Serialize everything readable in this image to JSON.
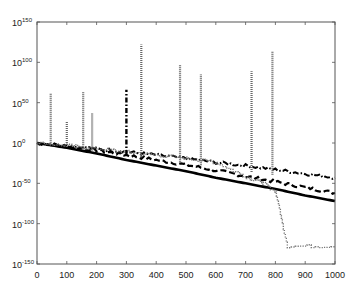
{
  "chart_data": {
    "type": "line",
    "title": "",
    "xlabel": "",
    "ylabel": "",
    "xlim": [
      0,
      1000
    ],
    "ylim_log10": [
      -150,
      150
    ],
    "yscale": "log",
    "grid": false,
    "legend": null,
    "x_ticks": [
      "0",
      "100",
      "200",
      "300",
      "400",
      "500",
      "600",
      "700",
      "800",
      "900",
      "1000"
    ],
    "y_ticks": [
      {
        "base": "10",
        "exp": "150"
      },
      {
        "base": "10",
        "exp": "100"
      },
      {
        "base": "10",
        "exp": "50"
      },
      {
        "base": "10",
        "exp": "0"
      },
      {
        "base": "10",
        "exp": "-50"
      },
      {
        "base": "10",
        "exp": "-100"
      },
      {
        "base": "10",
        "exp": "-150"
      }
    ],
    "series": [
      {
        "name": "solid",
        "style": "solid-thick",
        "x": [
          0,
          100,
          200,
          300,
          400,
          500,
          600,
          700,
          800,
          900,
          1000
        ],
        "log10_y": [
          0,
          -6,
          -13,
          -21,
          -28,
          -35,
          -43,
          -50,
          -57,
          -65,
          -72
        ]
      },
      {
        "name": "dashed",
        "style": "dashed",
        "x": [
          0,
          100,
          200,
          300,
          400,
          500,
          600,
          700,
          800,
          900,
          1000
        ],
        "log10_y": [
          0,
          -4,
          -9,
          -15,
          -21,
          -27,
          -34,
          -41,
          -48,
          -55,
          -62
        ]
      },
      {
        "name": "dash-dot",
        "style": "dash-dot",
        "x": [
          0,
          100,
          200,
          300,
          400,
          500,
          600,
          700,
          800,
          900,
          1000
        ],
        "log10_y": [
          0,
          -3,
          -7,
          -11,
          -15,
          -19,
          -24,
          -28,
          -33,
          -38,
          -43
        ]
      },
      {
        "name": "dotted",
        "style": "dotted",
        "x": [
          0,
          100,
          200,
          300,
          400,
          500,
          600,
          700,
          750,
          800,
          840,
          1000
        ],
        "log10_y": [
          0,
          -3,
          -7,
          -11,
          -15,
          -19,
          -24,
          -42,
          -48,
          -60,
          -128,
          -128
        ]
      }
    ],
    "spikes": [
      {
        "x": 46,
        "log10_peak": 62,
        "style": "dotted"
      },
      {
        "x": 100,
        "log10_peak": 26,
        "style": "dotted"
      },
      {
        "x": 155,
        "log10_peak": 63,
        "style": "dotted"
      },
      {
        "x": 185,
        "log10_peak": 37,
        "style": "dotted"
      },
      {
        "x": 300,
        "log10_peak": 66,
        "style": "dash-dot"
      },
      {
        "x": 350,
        "log10_peak": 122,
        "style": "dotted"
      },
      {
        "x": 480,
        "log10_peak": 97,
        "style": "dotted"
      },
      {
        "x": 550,
        "log10_peak": 85,
        "style": "dotted"
      },
      {
        "x": 720,
        "log10_peak": 89,
        "style": "dotted"
      },
      {
        "x": 790,
        "log10_peak": 113,
        "style": "dotted"
      }
    ]
  }
}
